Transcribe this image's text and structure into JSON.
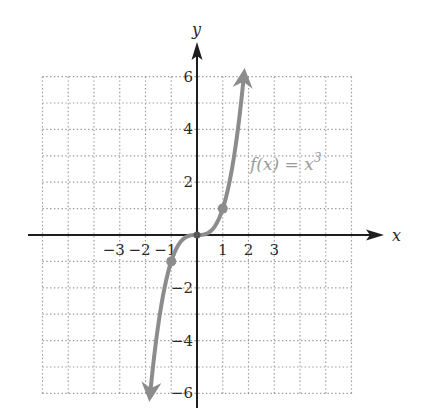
{
  "chart_data": {
    "type": "line",
    "title": "",
    "function_label": "f(x) = x³",
    "function_label_parts": {
      "name": "f(x) = x",
      "exponent": "3"
    },
    "xlabel": "x",
    "ylabel": "y",
    "xlim": [
      -6,
      6
    ],
    "ylim": [
      -6,
      6
    ],
    "grid": true,
    "grid_style": "dotted",
    "x_tick_labels": [
      "−3",
      "−2",
      "−1",
      "1",
      "2",
      "3"
    ],
    "x_tick_values": [
      -3,
      -2,
      -1,
      1,
      2,
      3
    ],
    "y_tick_labels": [
      "6",
      "4",
      "2",
      "−2",
      "−4",
      "−6"
    ],
    "y_tick_values": [
      6,
      4,
      2,
      -2,
      -4,
      -6
    ],
    "series": [
      {
        "name": "f(x) = x^3",
        "color": "#8c8c8c",
        "x": [
          -1.82,
          -1.5,
          -1.25,
          -1,
          -0.75,
          -0.5,
          -0.25,
          0,
          0.25,
          0.5,
          0.75,
          1,
          1.25,
          1.5,
          1.82
        ],
        "y": [
          -6.0,
          -3.375,
          -1.953,
          -1,
          -0.422,
          -0.125,
          -0.016,
          0,
          0.016,
          0.125,
          0.422,
          1,
          1.953,
          3.375,
          6.0
        ],
        "arrows_at_ends": true
      }
    ],
    "marked_points": [
      {
        "x": -1,
        "y": -1
      },
      {
        "x": 0,
        "y": 0
      },
      {
        "x": 1,
        "y": 1
      }
    ],
    "legend": "none"
  },
  "colors": {
    "axis": "#1e1e1e",
    "grid": "#9a9a9a",
    "curve": "#8c8c8c",
    "label": "#2a2a2a",
    "function_label": "#9a9a9a"
  }
}
